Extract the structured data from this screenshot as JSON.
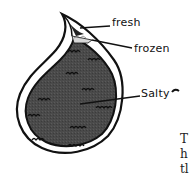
{
  "diagram": {
    "shape": "teardrop",
    "layers": [
      {
        "name": "fresh",
        "label": "fresh"
      },
      {
        "name": "frozen",
        "label": "frozen"
      },
      {
        "name": "salty",
        "label": "Salty"
      }
    ],
    "colors": {
      "outline": "#111111",
      "salty_fill": "#4a4a4a",
      "frozen_fill": "#d8d8d8",
      "fresh_fill": "#222222",
      "background": "#ffffff"
    }
  },
  "right_text": {
    "fragments": [
      "T",
      "h",
      "tl"
    ]
  }
}
